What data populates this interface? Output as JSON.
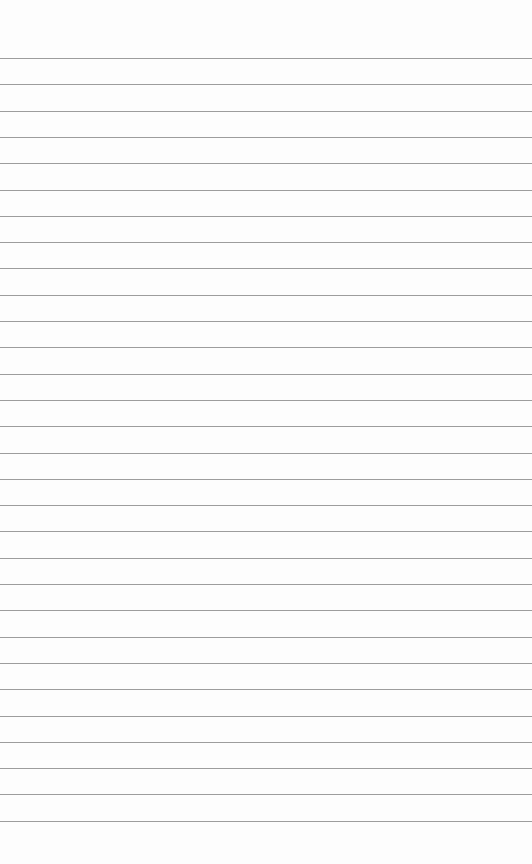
{
  "paper": {
    "type": "lined-paper",
    "background": "#fdfdfd",
    "line_color": "#8c8c8c",
    "line_count": 30,
    "first_line_y": 58,
    "line_spacing": 26.3
  }
}
